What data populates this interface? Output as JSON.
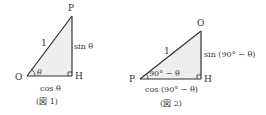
{
  "figure1": {
    "caption": "(図 1)",
    "vertices": {
      "O": "O",
      "P": "P",
      "H": "H"
    },
    "hypotenuse_label": "1",
    "vertical_label": "sin θ",
    "horizontal_label": "cos θ",
    "angle_label": "θ"
  },
  "figure2": {
    "caption": "(図 2)",
    "vertices": {
      "O": "O",
      "P": "P",
      "H": "H"
    },
    "hypotenuse_label": "1",
    "vertical_label": "sin (90° − θ)",
    "horizontal_label": "cos (90° − θ)",
    "angle_label": "90° − θ"
  },
  "colors": {
    "fill": "#eeeeee",
    "stroke": "#333333"
  }
}
